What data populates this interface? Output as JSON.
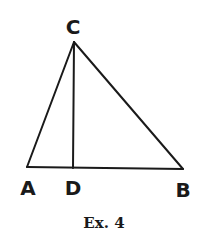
{
  "diagram": {
    "type": "triangle",
    "points": {
      "A": {
        "label": "A",
        "x": 27,
        "y": 167
      },
      "B": {
        "label": "B",
        "x": 183,
        "y": 169
      },
      "C": {
        "label": "C",
        "x": 74,
        "y": 42
      },
      "D": {
        "label": "D",
        "x": 73,
        "y": 168
      }
    },
    "segments": [
      "AB",
      "BC",
      "CA",
      "CD"
    ],
    "stroke_color": "#1a1a1a"
  },
  "caption": "Ex. 4"
}
